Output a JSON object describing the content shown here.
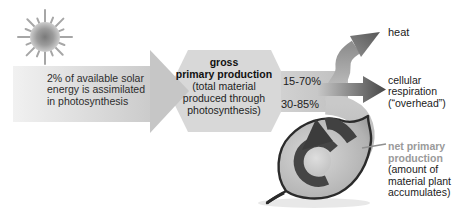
{
  "solar": {
    "lines": [
      "2% of available solar",
      "energy is assimilated",
      "in photosynthesis"
    ]
  },
  "gpp": {
    "title_lines": [
      "gross",
      "primary production"
    ],
    "subtitle_lines": [
      "(total material",
      "produced through",
      "photosynthesis)"
    ]
  },
  "pct": {
    "heat_and_respiration": "15-70%",
    "net_production": "30-85%"
  },
  "heat": {
    "label": "heat"
  },
  "resp": {
    "lines": [
      "cellular",
      "respiration",
      "(“overhead”)"
    ]
  },
  "npp": {
    "title_lines": [
      "net primary",
      "production"
    ],
    "subtitle_lines": [
      "(amount of",
      "material plant",
      "accumulates)"
    ]
  },
  "icons": {
    "sun": "sun-icon",
    "leaf": "leaf-icon",
    "heat_arrow": "heat-arrow-icon",
    "respiration_arrow": "respiration-arrow-icon",
    "npp_curl_arrow": "npp-curl-arrow-icon"
  },
  "colors": {
    "background": "#ffffff",
    "band_light": "#ededed",
    "band_mid": "#c9c9c9",
    "hexagon_gray": "#d8d8d8",
    "dark_arrow_gray": "#4d4d4d",
    "leaf_outline": "#2b2b2b",
    "npp_label_gray": "#9a9a9a",
    "text_black": "#1e1e1e"
  }
}
